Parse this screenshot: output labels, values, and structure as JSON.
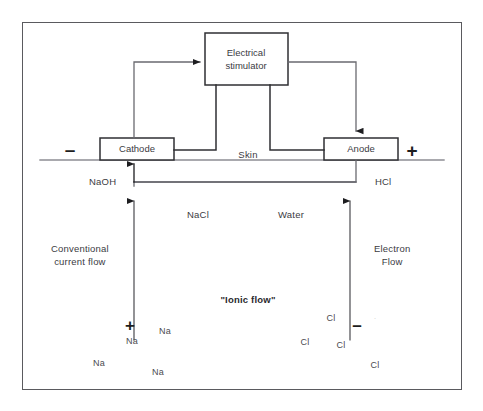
{
  "figure": {
    "kind": "iontophoresis-circuit-diagram",
    "border_color": "#5a5a5e",
    "background": "#ffffff",
    "line_color": "#4a4a4f"
  },
  "stimulator": {
    "line1": "Electrical",
    "line2": "stimulator"
  },
  "electrodes": {
    "cathode": "Cathode",
    "anode": "Anode",
    "negative_sign": "–",
    "positive_sign": "+"
  },
  "skin": {
    "label": "Skin"
  },
  "products": {
    "left": "NaOH",
    "right": "HCl"
  },
  "solution": {
    "salt": "NaCl",
    "water": "Water"
  },
  "flows": {
    "conventional_line1": "Conventional",
    "conventional_line2": "current flow",
    "electron_line1": "Electron",
    "electron_line2": "Flow",
    "ionic": "\"Ionic flow\""
  },
  "ions": {
    "sodium_symbol": "Na",
    "sodium_charge": "+",
    "chloride_symbol": "Cl",
    "chloride_charge": "–",
    "sodium_positions": [
      {
        "x": 165,
        "y": 331
      },
      {
        "x": 132,
        "y": 341
      },
      {
        "x": 99,
        "y": 363
      },
      {
        "x": 158,
        "y": 372
      }
    ],
    "chloride_positions": [
      {
        "x": 331,
        "y": 318
      },
      {
        "x": 305,
        "y": 342
      },
      {
        "x": 341,
        "y": 345
      },
      {
        "x": 375,
        "y": 365
      }
    ],
    "sodium_charge_position": {
      "x": 130,
      "y": 325
    },
    "chloride_charge_position": {
      "x": 357,
      "y": 325
    },
    "artifact_mark": {
      "x": 375,
      "y": 318,
      "glyph": "·"
    }
  }
}
